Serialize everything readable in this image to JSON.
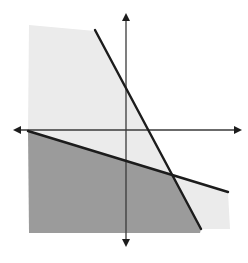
{
  "figure": {
    "type": "system-of-linear-inequalities-graph",
    "labels": [],
    "colors": {
      "background": "#ffffff",
      "light_region": "#ebebeb",
      "dark_region": "#9b9b9b",
      "lines": "#1c1c1c",
      "axes": "#3a3a3a"
    },
    "axes": {
      "origin_px": [
        126,
        130
      ],
      "x_axis": {
        "from_px": [
          13,
          130
        ],
        "to_px": [
          242,
          130
        ],
        "arrows": "both"
      },
      "y_axis": {
        "from_px": [
          126,
          13
        ],
        "to_px": [
          126,
          247
        ],
        "arrows": "both"
      }
    },
    "boundary_lines": [
      {
        "name": "steep-line",
        "from_px": [
          95,
          30
        ],
        "to_px": [
          201,
          229
        ],
        "slope_sign": "negative",
        "style": "solid"
      },
      {
        "name": "shallow-line",
        "from_px": [
          28,
          131
        ],
        "to_px": [
          228,
          192
        ],
        "slope_sign": "negative",
        "style": "solid"
      }
    ],
    "intersection_px": [
      173,
      175
    ],
    "regions": [
      {
        "name": "light-shaded-region",
        "description": "single-shaded area (satisfies one inequality)"
      },
      {
        "name": "dark-shaded-region",
        "description": "overlap area below both lines (solution set)"
      }
    ]
  }
}
